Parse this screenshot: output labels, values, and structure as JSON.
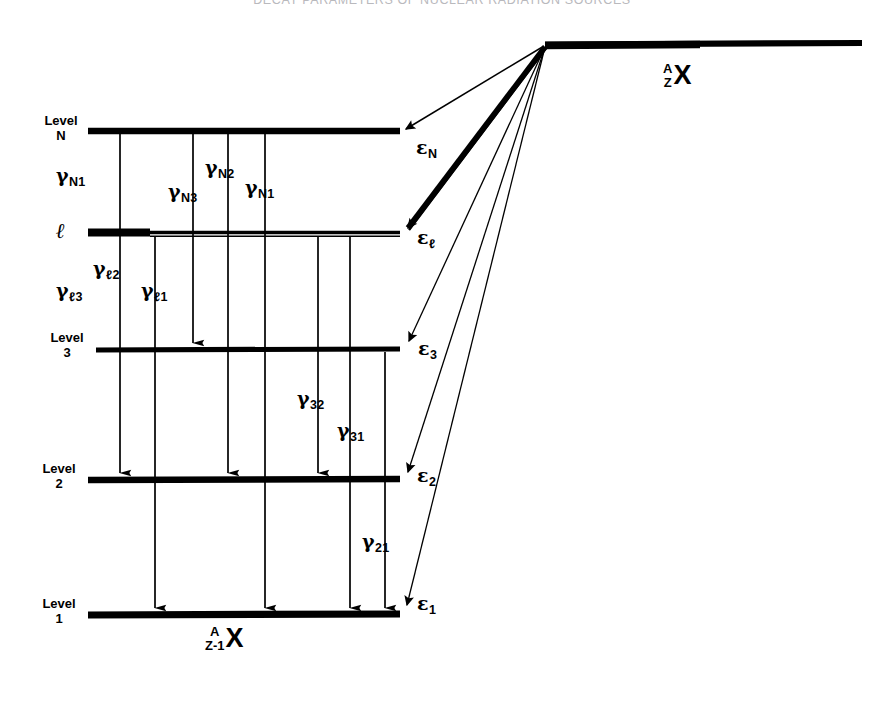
{
  "page": {
    "running_head": "DECAY PARAMETERS OF NUCLEAR RADIATION SOURCES",
    "folio": ""
  },
  "figure": {
    "name": "nuclear-decay-scheme",
    "parent_nuclide": {
      "mass_number": "A",
      "atomic_number": "Z",
      "symbol": "X"
    },
    "daughter_nuclide": {
      "mass_number": "A",
      "atomic_number": "Z-1",
      "symbol": "X"
    },
    "levels": [
      {
        "id": "N",
        "caption_word": "Level",
        "caption_num": "N"
      },
      {
        "id": "l",
        "caption_word": "",
        "caption_num": "ℓ"
      },
      {
        "id": "3",
        "caption_word": "Level",
        "caption_num": "3"
      },
      {
        "id": "2",
        "caption_word": "Level",
        "caption_num": "2"
      },
      {
        "id": "1",
        "caption_word": "Level",
        "caption_num": "1"
      }
    ],
    "energies": [
      {
        "id": "eps-N",
        "symbol": "ε",
        "subscript": "N"
      },
      {
        "id": "eps-l",
        "symbol": "ε",
        "subscript": "ℓ"
      },
      {
        "id": "eps-3",
        "symbol": "ε",
        "subscript": "3"
      },
      {
        "id": "eps-2",
        "symbol": "ε",
        "subscript": "2"
      },
      {
        "id": "eps-1",
        "symbol": "ε",
        "subscript": "1"
      }
    ],
    "gammas": [
      {
        "id": "g-N1-left",
        "symbol": "γ",
        "subscript": "N1"
      },
      {
        "id": "g-N3",
        "symbol": "γ",
        "subscript": "N3"
      },
      {
        "id": "g-N2",
        "symbol": "γ",
        "subscript": "N2"
      },
      {
        "id": "g-N1",
        "symbol": "γ",
        "subscript": "N1"
      },
      {
        "id": "g-l3",
        "symbol": "γ",
        "subscript": "ℓ3"
      },
      {
        "id": "g-l2",
        "symbol": "γ",
        "subscript": "ℓ2"
      },
      {
        "id": "g-l1",
        "symbol": "γ",
        "subscript": "ℓ1"
      },
      {
        "id": "g-32",
        "symbol": "γ",
        "subscript": "32"
      },
      {
        "id": "g-31",
        "symbol": "γ",
        "subscript": "31"
      },
      {
        "id": "g-21",
        "symbol": "γ",
        "subscript": "21"
      }
    ]
  }
}
